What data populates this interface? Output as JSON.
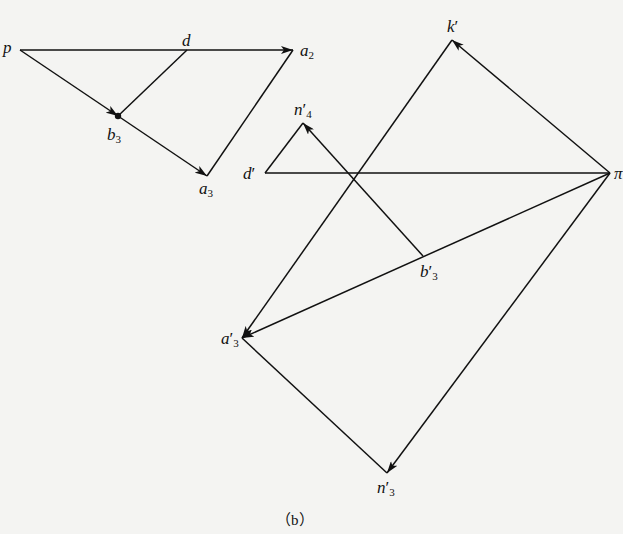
{
  "figure": {
    "caption": "（b）",
    "line_color": "#111111",
    "background": "#f4f4f2"
  },
  "points": {
    "p": {
      "name": "p",
      "sub": "",
      "prime": ""
    },
    "d": {
      "name": "d",
      "sub": "",
      "prime": ""
    },
    "a2": {
      "name": "a",
      "sub": "2",
      "prime": ""
    },
    "b3": {
      "name": "b",
      "sub": "3",
      "prime": ""
    },
    "a3": {
      "name": "a",
      "sub": "3",
      "prime": ""
    },
    "k_p": {
      "name": "k",
      "sub": "",
      "prime": "′"
    },
    "n4_p": {
      "name": "n",
      "sub": "4",
      "prime": "′"
    },
    "d_p": {
      "name": "d",
      "sub": "",
      "prime": "′"
    },
    "pi": {
      "name": "π",
      "sub": "",
      "prime": ""
    },
    "b3_p": {
      "name": "b",
      "sub": "3",
      "prime": "′"
    },
    "a3_p": {
      "name": "a",
      "sub": "3",
      "prime": "′"
    },
    "n3_p": {
      "name": "n",
      "sub": "3",
      "prime": "′"
    }
  },
  "diagram_left": {
    "segments": [
      {
        "from": "p",
        "to": "a2",
        "arrow": true
      },
      {
        "from": "p",
        "to": "b3",
        "arrow": true
      },
      {
        "from": "b3",
        "to": "a3",
        "arrow": true
      },
      {
        "from": "d",
        "to": "b3",
        "arrow": false
      },
      {
        "from": "a3",
        "to": "a2",
        "arrow": false
      }
    ]
  },
  "diagram_right": {
    "segments": [
      {
        "from": "pi",
        "to": "k_p",
        "arrow": true
      },
      {
        "from": "k_p",
        "to": "a3_p",
        "arrow": true
      },
      {
        "from": "pi",
        "to": "a3_p",
        "arrow": true
      },
      {
        "from": "pi",
        "to": "n3_p",
        "arrow": true
      },
      {
        "from": "a3_p",
        "to": "n3_p",
        "arrow": false
      },
      {
        "from": "d_p",
        "to": "pi",
        "arrow": false
      },
      {
        "from": "d_p",
        "to": "n4_p",
        "arrow": false
      },
      {
        "from": "b3_p",
        "to": "n4_p",
        "arrow": true
      }
    ]
  }
}
